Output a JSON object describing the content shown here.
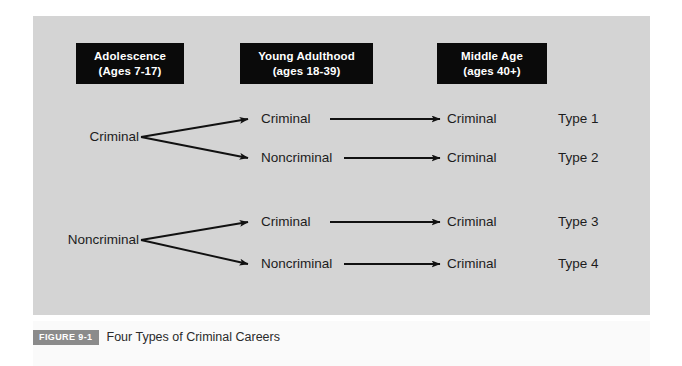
{
  "figure": {
    "badge": "FIGURE 9-1",
    "caption": "Four Types of Criminal Careers"
  },
  "columns": [
    {
      "title": "Adolescence",
      "subtitle": "(Ages 7-17)"
    },
    {
      "title": "Young Adulthood",
      "subtitle": "(ages 18-39)"
    },
    {
      "title": "Middle Age",
      "subtitle": "(ages 40+)"
    }
  ],
  "sources": [
    {
      "label": "Criminal"
    },
    {
      "label": "Noncriminal"
    }
  ],
  "rows": [
    {
      "young_adulthood": "Criminal",
      "middle_age": "Criminal",
      "type": "Type 1"
    },
    {
      "young_adulthood": "Noncriminal",
      "middle_age": "Criminal",
      "type": "Type 2"
    },
    {
      "young_adulthood": "Criminal",
      "middle_age": "Criminal",
      "type": "Type 3"
    },
    {
      "young_adulthood": "Noncriminal",
      "middle_age": "Criminal",
      "type": "Type 4"
    }
  ],
  "colors": {
    "panel_background": "#d4d4d4",
    "header_box": "#0a0a0a",
    "header_text": "#ffffff",
    "node_text": "#1c1c1c",
    "arrow": "#111111",
    "badge_background": "#8b8b8b",
    "page_background": "#ffffff"
  }
}
